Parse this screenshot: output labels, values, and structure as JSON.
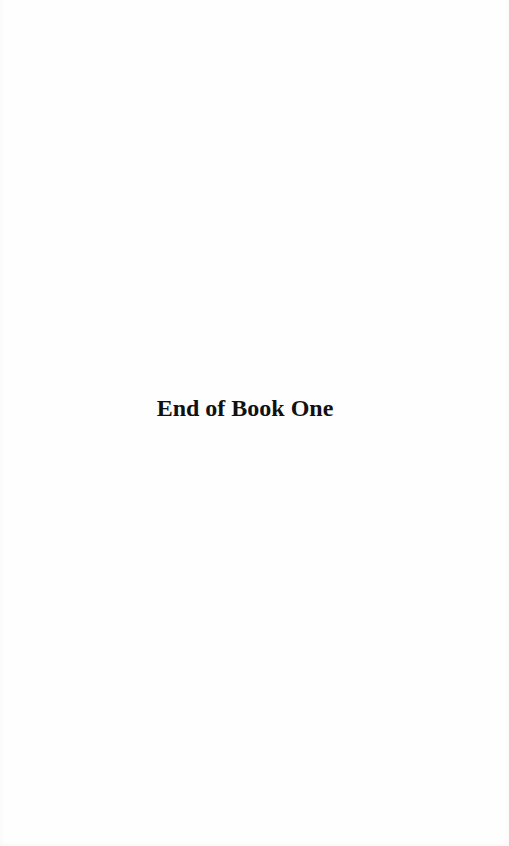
{
  "page": {
    "heading": "End of Book One"
  },
  "colors": {
    "background": "#fefefe",
    "text": "#111111"
  }
}
